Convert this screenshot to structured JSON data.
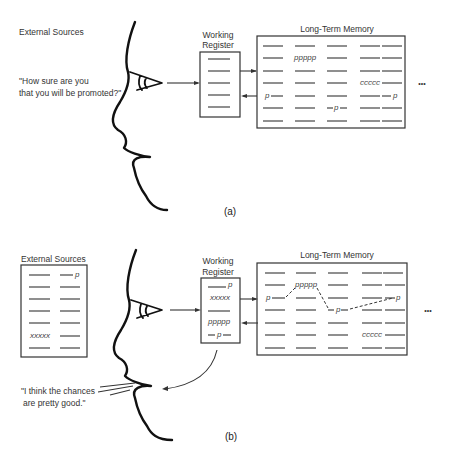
{
  "panel_a": {
    "caption": "(a)",
    "external_sources_label": "External Sources",
    "question_line1": "\"How sure are you",
    "question_line2": "that you will be promoted?\"",
    "working_register_label1": "Working",
    "working_register_label2": "Register",
    "ltm_label": "Long-Term Memory",
    "ltm_items": {
      "ppppp": "ppppp",
      "ccccc": "ccccc",
      "p1": "p",
      "p2": "p",
      "p3": "p"
    },
    "ellipsis": "•••"
  },
  "panel_b": {
    "caption": "(b)",
    "external_sources_label": "External Sources",
    "external_items": {
      "p": "p",
      "xxxxx": "xxxxx"
    },
    "working_register_label1": "Working",
    "working_register_label2": "Register",
    "wr_items": {
      "p_top": "p",
      "xxxxx": "xxxxx",
      "ppppp": "ppppp",
      "p_bottom": "p"
    },
    "ltm_label": "Long-Term Memory",
    "ltm_items": {
      "ppppp": "ppppp",
      "ccccc": "ccccc",
      "p1": "p",
      "p2": "p",
      "p3": "p"
    },
    "ellipsis": "•••",
    "answer_line1": "\"I think the chances",
    "answer_line2": "are pretty good.\""
  }
}
